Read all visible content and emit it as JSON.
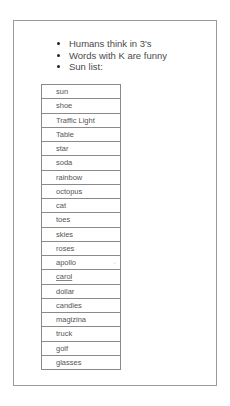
{
  "bullets": [
    {
      "text": "Humans think in 3's"
    },
    {
      "text": "Words with K are funny"
    },
    {
      "text": "Sun list:"
    }
  ],
  "sun_list": [
    {
      "text": "sun"
    },
    {
      "text": "shoe"
    },
    {
      "text": "Traffic Light"
    },
    {
      "text": "Table"
    },
    {
      "text": "star"
    },
    {
      "text": "soda"
    },
    {
      "text": "rainbow"
    },
    {
      "text": "octopus"
    },
    {
      "text": "cat"
    },
    {
      "text": "toes"
    },
    {
      "text": "skies"
    },
    {
      "text": "roses"
    },
    {
      "text": "apollo"
    },
    {
      "text": "carol"
    },
    {
      "text": "dollar"
    },
    {
      "text": "candles"
    },
    {
      "text": "magizina"
    },
    {
      "text": "truck"
    },
    {
      "text": "golf"
    },
    {
      "text": "glasses"
    }
  ],
  "icons": {
    "row_handle": "chevron-down-icon"
  },
  "colors": {
    "page_border": "#9a9a9a",
    "table_border": "#8a8a8a",
    "text": "#555555"
  }
}
